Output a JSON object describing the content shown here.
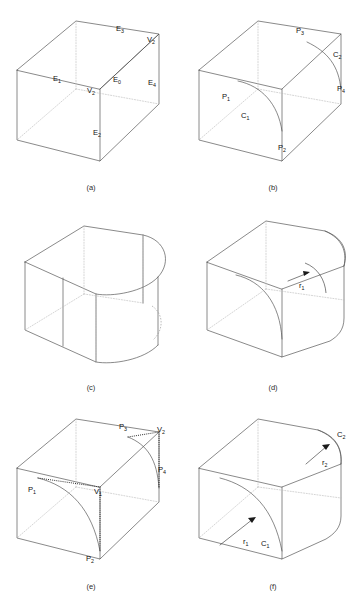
{
  "figure": {
    "panel_count": 6,
    "line_colors": {
      "visible_edge": "#4a4a4a",
      "hidden_edge": "#b9b9b9",
      "construction_dotted": "#2a2a2a",
      "background": "#ffffff",
      "text": "#111111"
    }
  },
  "panels": [
    {
      "id": "a",
      "caption": "(a)",
      "description": "box with labelled edges and vertices",
      "labels": [
        {
          "name": "edge-E3",
          "base": "E",
          "sub": "3"
        },
        {
          "name": "vertex-V2",
          "base": "V",
          "sub": "2"
        },
        {
          "name": "edge-E1",
          "base": "E",
          "sub": "1"
        },
        {
          "name": "vertex-V1",
          "base": "V",
          "sub": "1"
        },
        {
          "name": "edge-E0",
          "base": "E",
          "sub": "0"
        },
        {
          "name": "edge-E4",
          "base": "E",
          "sub": "4"
        },
        {
          "name": "edge-E2",
          "base": "E",
          "sub": "2"
        }
      ]
    },
    {
      "id": "b",
      "caption": "(b)",
      "description": "blend boundary points and curves",
      "labels": [
        {
          "name": "point-P3",
          "base": "P",
          "sub": "3"
        },
        {
          "name": "curve-C2",
          "base": "C",
          "sub": "2"
        },
        {
          "name": "point-P4",
          "base": "P",
          "sub": "4"
        },
        {
          "name": "point-P1",
          "base": "P",
          "sub": "1"
        },
        {
          "name": "curve-C1",
          "base": "C",
          "sub": "1"
        },
        {
          "name": "point-P2",
          "base": "P",
          "sub": "2"
        }
      ]
    },
    {
      "id": "c",
      "caption": "(c)",
      "description": "large radius blend producing rounded end",
      "labels": []
    },
    {
      "id": "d",
      "caption": "(d)",
      "description": "blend with radius dimension r1",
      "labels": [
        {
          "name": "radius-r1",
          "base": "r",
          "sub": "1"
        }
      ]
    },
    {
      "id": "e",
      "caption": "(e)",
      "description": "concave blend with construction points",
      "labels": [
        {
          "name": "point-P3",
          "base": "P",
          "sub": "3"
        },
        {
          "name": "vertex-V2",
          "base": "V",
          "sub": "2"
        },
        {
          "name": "point-P4",
          "base": "P",
          "sub": "4"
        },
        {
          "name": "point-P1",
          "base": "P",
          "sub": "1"
        },
        {
          "name": "vertex-V1",
          "base": "V",
          "sub": "1"
        },
        {
          "name": "point-P2",
          "base": "P",
          "sub": "2"
        }
      ]
    },
    {
      "id": "f",
      "caption": "(f)",
      "description": "two blends with radii r1 and r2 on curves C1 and C2",
      "labels": [
        {
          "name": "curve-C2",
          "base": "C",
          "sub": "2"
        },
        {
          "name": "radius-r2",
          "base": "r",
          "sub": "2"
        },
        {
          "name": "radius-r1",
          "base": "r",
          "sub": "1"
        },
        {
          "name": "curve-C1",
          "base": "C",
          "sub": "1"
        }
      ]
    }
  ]
}
